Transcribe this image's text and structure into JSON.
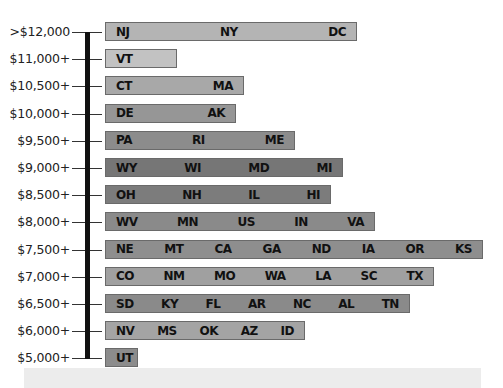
{
  "chart_data": {
    "type": "bar",
    "title": "",
    "xlabel": "",
    "ylabel": "Per-pupil spending tier",
    "orientation": "horizontal",
    "categories": [
      ">$12,000",
      "$11,000+",
      "$10,500+",
      "$10,000+",
      "$9,500+",
      "$9,000+",
      "$8,500+",
      "$8,000+",
      "$7,500+",
      "$7,000+",
      "$6,500+",
      "$6,000+",
      "$5,000+"
    ],
    "rows": [
      {
        "label": ">$12,000",
        "states": [
          "NJ",
          "NY",
          "DC"
        ],
        "width": 252,
        "color": "#b4b4b4"
      },
      {
        "label": "$11,000+",
        "states": [
          "VT"
        ],
        "width": 72,
        "color": "#c2c2c2"
      },
      {
        "label": "$10,500+",
        "states": [
          "CT",
          "MA"
        ],
        "width": 139,
        "color": "#a8a8a8"
      },
      {
        "label": "$10,000+",
        "states": [
          "DE",
          "AK"
        ],
        "width": 131,
        "color": "#969696"
      },
      {
        "label": "$9,500+",
        "states": [
          "PA",
          "RI",
          "ME"
        ],
        "width": 190,
        "color": "#8c8c8c"
      },
      {
        "label": "$9,000+",
        "states": [
          "WY",
          "WI",
          "MD",
          "MI"
        ],
        "width": 238,
        "color": "#767676"
      },
      {
        "label": "$8,500+",
        "states": [
          "OH",
          "NH",
          "IL",
          "HI"
        ],
        "width": 226,
        "color": "#7c7c7c"
      },
      {
        "label": "$8,000+",
        "states": [
          "WV",
          "MN",
          "US",
          "IN",
          "VA"
        ],
        "width": 270,
        "color": "#8a8a8a"
      },
      {
        "label": "$7,500+",
        "states": [
          "NE",
          "MT",
          "CA",
          "GA",
          "ND",
          "IA",
          "OR",
          "KS"
        ],
        "width": 378,
        "color": "#8e8e8e"
      },
      {
        "label": "$7,000+",
        "states": [
          "CO",
          "NM",
          "MO",
          "WA",
          "LA",
          "SC",
          "TX"
        ],
        "width": 329,
        "color": "#a0a0a0"
      },
      {
        "label": "$6,500+",
        "states": [
          "SD",
          "KY",
          "FL",
          "AR",
          "NC",
          "AL",
          "TN"
        ],
        "width": 305,
        "color": "#8a8a8a"
      },
      {
        "label": "$6,000+",
        "states": [
          "NV",
          "MS",
          "OK",
          "AZ",
          "ID"
        ],
        "width": 200,
        "color": "#a4a4a4"
      },
      {
        "label": "$5,000+",
        "states": [
          "UT"
        ],
        "width": 33,
        "color": "#8c8c8c"
      }
    ],
    "values": [
      3,
      1,
      2,
      2,
      3,
      4,
      4,
      5,
      8,
      7,
      7,
      5,
      1
    ],
    "legend": [],
    "grid": false
  }
}
